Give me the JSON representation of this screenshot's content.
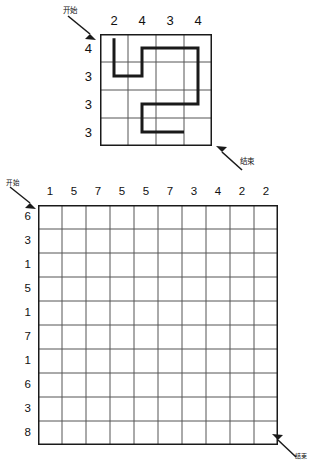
{
  "puzzle": {
    "kind": "grid-path-puzzle",
    "line_color": "#1a1a1a",
    "grid_color": "#555555"
  },
  "top_puzzle": {
    "name": "example-grid",
    "columns": 4,
    "rows": 4,
    "cell_size": 28,
    "col_clues": [
      "2",
      "4",
      "3",
      "4"
    ],
    "row_clues": [
      "4",
      "3",
      "3",
      "3"
    ],
    "start_label": "开始",
    "end_label": "结束",
    "path": {
      "stroke_width": 3,
      "points": [
        [
          0.5,
          0.15
        ],
        [
          0.5,
          1.5
        ],
        [
          1.5,
          1.5
        ],
        [
          1.5,
          0.5
        ],
        [
          3.5,
          0.5
        ],
        [
          3.5,
          2.5
        ],
        [
          1.5,
          2.5
        ],
        [
          1.5,
          3.5
        ],
        [
          3.0,
          3.5
        ]
      ]
    }
  },
  "bottom_puzzle": {
    "name": "blank-grid",
    "columns": 10,
    "rows": 10,
    "cell_size": 24,
    "col_clues": [
      "1",
      "5",
      "7",
      "5",
      "5",
      "7",
      "3",
      "4",
      "2",
      "2"
    ],
    "row_clues": [
      "6",
      "3",
      "1",
      "5",
      "1",
      "7",
      "1",
      "6",
      "3",
      "8"
    ],
    "start_label": "开始",
    "end_label": "结束",
    "path": {
      "stroke_width": 3,
      "points": []
    }
  }
}
